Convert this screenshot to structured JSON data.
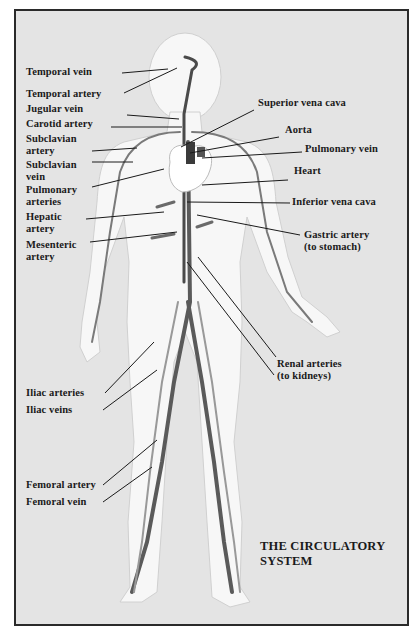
{
  "title": {
    "line1": "THE CIRCULATORY",
    "line2": "SYSTEM"
  },
  "labels_left": [
    {
      "id": "temporal-vein",
      "lines": [
        "Temporal vein"
      ]
    },
    {
      "id": "temporal-artery",
      "lines": [
        "Temporal artery"
      ]
    },
    {
      "id": "jugular-vein",
      "lines": [
        "Jugular vein"
      ]
    },
    {
      "id": "carotid-artery",
      "lines": [
        "Carotid artery"
      ]
    },
    {
      "id": "subclavian-artery",
      "lines": [
        "Subclavian",
        "artery"
      ]
    },
    {
      "id": "subclavian-vein",
      "lines": [
        "Subclavian",
        "vein"
      ]
    },
    {
      "id": "pulmonary-arteries",
      "lines": [
        "Pulmonary",
        "arteries"
      ]
    },
    {
      "id": "hepatic-artery",
      "lines": [
        "Hepatic",
        "artery"
      ]
    },
    {
      "id": "mesenteric-artery",
      "lines": [
        "Mesenteric",
        "artery"
      ]
    },
    {
      "id": "iliac-arteries",
      "lines": [
        "Iliac arteries"
      ]
    },
    {
      "id": "iliac-veins",
      "lines": [
        "Iliac veins"
      ]
    },
    {
      "id": "femoral-artery",
      "lines": [
        "Femoral artery"
      ]
    },
    {
      "id": "femoral-vein",
      "lines": [
        "Femoral vein"
      ]
    }
  ],
  "labels_right": [
    {
      "id": "superior-vena-cava",
      "lines": [
        "Superior vena cava"
      ]
    },
    {
      "id": "aorta",
      "lines": [
        "Aorta"
      ]
    },
    {
      "id": "pulmonary-vein",
      "lines": [
        "Pulmonary vein"
      ]
    },
    {
      "id": "heart",
      "lines": [
        "Heart"
      ]
    },
    {
      "id": "inferior-vena-cava",
      "lines": [
        "Inferior vena cava"
      ]
    },
    {
      "id": "gastric-artery",
      "lines": [
        "Gastric artery",
        "(to stomach)"
      ]
    },
    {
      "id": "renal-arteries",
      "lines": [
        "Renal arteries",
        "(to kidneys)"
      ]
    }
  ],
  "colors": {
    "background": "#e4e4e4",
    "body_silhouette": "#f7f7f7",
    "vessel_dark": "#4a4a4a",
    "vessel_light": "#8c8c8c",
    "leader_line": "#1a1a1a",
    "border": "#2a2a2a"
  }
}
